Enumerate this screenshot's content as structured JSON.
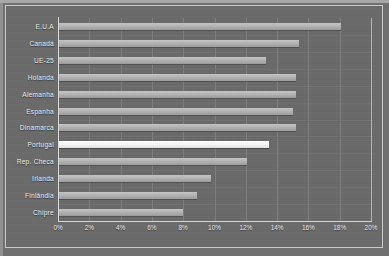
{
  "chart_data": {
    "type": "bar",
    "orientation": "horizontal",
    "title": "",
    "subtitle": "",
    "xlabel": "",
    "ylabel": "",
    "xlim": [
      0,
      20
    ],
    "xtick_labels": [
      "0%",
      "2%",
      "4%",
      "6%",
      "8%",
      "10%",
      "12%",
      "14%",
      "16%",
      "18%",
      "20%"
    ],
    "xtick_values": [
      0,
      2,
      4,
      6,
      8,
      10,
      12,
      14,
      16,
      18,
      20
    ],
    "xtick_suffix": "%",
    "grid": "vertical",
    "legend": "none",
    "categories": [
      "E.U.A",
      "Canadá",
      "UE-25",
      "Holanda",
      "Alemanha",
      "Espanha",
      "Dinamarca",
      "Portugal",
      "Rep. Checa",
      "Irlanda",
      "Finlândia",
      "Chipre"
    ],
    "values": [
      18.1,
      15.4,
      13.3,
      15.2,
      15.2,
      15.0,
      15.2,
      13.5,
      12.1,
      9.8,
      8.9,
      8.0
    ],
    "highlighted_category": "Portugal",
    "series": [
      {
        "name": "",
        "values": [
          18.1,
          15.4,
          13.3,
          15.2,
          15.2,
          15.0,
          15.2,
          13.5,
          12.1,
          9.8,
          8.9,
          8.0
        ]
      }
    ]
  },
  "style": {
    "background": "#707070",
    "plot_background": "#6a6a6a",
    "frame_border": "#c9c9c9",
    "bar_color": "#b4b4b4",
    "highlight_bar_color": "#ffffff",
    "gridline_color": "#8c8c8c",
    "axis_color": "#d8d8d8",
    "label_color": "#efefef"
  }
}
